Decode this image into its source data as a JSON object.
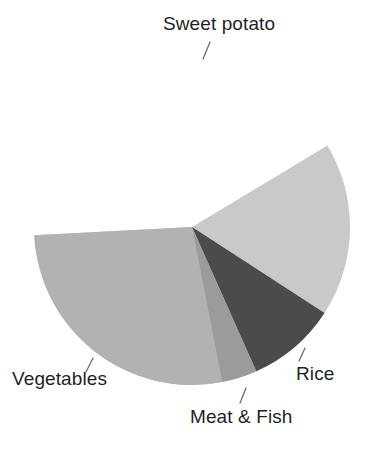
{
  "chart_data": {
    "type": "pie",
    "title": "",
    "subtitle": "",
    "xlabel": "",
    "ylabel": "",
    "legend_position": "none",
    "grid": false,
    "labels_placement": "outside-with-leader-lines",
    "categories": [
      "Sweet potato",
      "Vegetables",
      "Rice",
      "Meat & Fish"
    ],
    "values": [
      58,
      29,
      9.5,
      3.5
    ],
    "units": "percent",
    "slices": [
      {
        "label": "Sweet potato",
        "value": 58,
        "color": "#c9c9c9",
        "start_angle_deg": 183,
        "end_angle_deg": 391
      },
      {
        "label": "Rice",
        "value": 9.5,
        "color": "#4b4b4b",
        "start_angle_deg": 327,
        "end_angle_deg": 294
      },
      {
        "label": "Meat & Fish",
        "value": 3.5,
        "color": "#9b9b9b",
        "start_angle_deg": 294,
        "end_angle_deg": 281
      },
      {
        "label": "Vegetables",
        "value": 29,
        "color": "#b2b2b2",
        "start_angle_deg": 281,
        "end_angle_deg": 183
      }
    ],
    "colors": {
      "sweet_potato": "#c9c9c9",
      "vegetables": "#b2b2b2",
      "meat_and_fish": "#9b9b9b",
      "rice": "#4b4b4b",
      "background": "#ffffff",
      "text": "#1f1f1f",
      "leader_line": "#6e6e6e"
    }
  },
  "labels": {
    "sweet_potato": "Sweet potato",
    "vegetables": "Vegetables",
    "meat_and_fish": "Meat & Fish",
    "rice": "Rice"
  }
}
